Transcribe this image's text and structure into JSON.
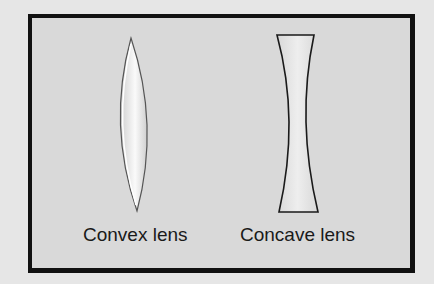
{
  "diagram": {
    "background": "#e6e6e6",
    "panel_fill": "#d9d9d9",
    "border_color": "#111111",
    "lenses": [
      {
        "type": "convex",
        "label": "Convex lens",
        "fill": "#eeeeee",
        "outline": "#333333"
      },
      {
        "type": "concave",
        "label": "Concave lens",
        "fill": "#e8e8e8",
        "outline": "#1a1a1a"
      }
    ]
  }
}
